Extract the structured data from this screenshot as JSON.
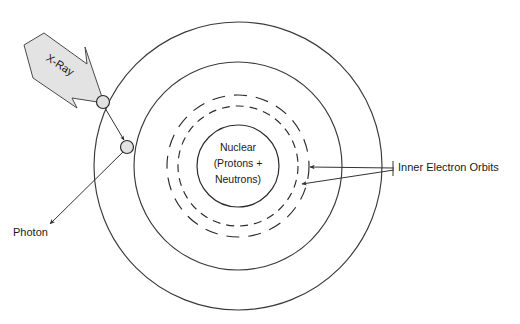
{
  "diagram": {
    "canvas": {
      "width": 520,
      "height": 324,
      "background": "#ffffff"
    },
    "colors": {
      "stroke": "#2b2b2b",
      "orbit_stroke": "#3a3a3a",
      "leader_stroke": "#333333",
      "arrow_fill": "#e3e3e3",
      "arrow_stroke": "#4a4a4a",
      "electron_fill": "#e2e2e2",
      "text": "#1a1a1a"
    },
    "nucleus": {
      "line1": "Nuclear",
      "line2": "(Protons +",
      "line3": "Neutrons)",
      "center_x": 238,
      "center_y": 166,
      "radius": 41
    },
    "orbits": [
      {
        "name": "outer-orbit-1",
        "style": "solid",
        "radius": 144
      },
      {
        "name": "outer-orbit-2",
        "style": "solid",
        "radius": 104
      },
      {
        "name": "inner-orbit-dashed-outer",
        "style": "dashed",
        "radius": 71
      },
      {
        "name": "inner-orbit-dashed-inner",
        "style": "dashed",
        "radius": 60
      }
    ],
    "electrons": [
      {
        "name": "electron-struck",
        "x": 103,
        "y": 102,
        "radius": 6.5
      },
      {
        "name": "electron-ejected",
        "x": 127,
        "y": 147,
        "radius": 6.5
      }
    ],
    "labels": {
      "xray": "X-Ray",
      "photon": "Photon",
      "inner_orbits": "Inner Electron Orbits"
    },
    "annotations": {
      "inner_orbits_leader_x": 398,
      "inner_orbits_leader_y": 171,
      "photon_x": 13,
      "photon_y": 236
    }
  }
}
